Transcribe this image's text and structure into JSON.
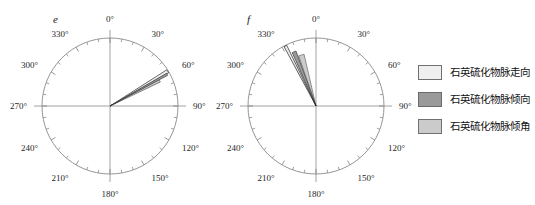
{
  "figure": {
    "background": "#ffffff",
    "panels": [
      {
        "id": "e",
        "label": "e",
        "center_x": 110,
        "center_y": 106,
        "radius": 68,
        "tick_labels": [
          "0°",
          "30°",
          "60°",
          "90°",
          "120°",
          "150°",
          "180°",
          "210°",
          "240°",
          "270°",
          "300°",
          "330°"
        ]
      },
      {
        "id": "f",
        "label": "f",
        "center_x": 110,
        "center_y": 106,
        "radius": 68,
        "tick_labels": [
          "0°",
          "30°",
          "60°",
          "90°",
          "120°",
          "150°",
          "180°",
          "210°",
          "240°",
          "270°",
          "300°",
          "330°"
        ]
      }
    ]
  },
  "legend": {
    "items": [
      {
        "label": "石英硫化物脉走向",
        "color": "#efefef",
        "border": "#707070"
      },
      {
        "label": "石英硫化物脉倾向",
        "color": "#9a9a9a",
        "border": "#6a6a6a"
      },
      {
        "label": "石英硫化物脉倾角",
        "color": "#cbcbcb",
        "border": "#707070"
      }
    ]
  },
  "chart_data": [
    {
      "type": "rose",
      "id": "e",
      "title": "e",
      "angle_unit": "degrees",
      "angle_zero": "north",
      "angle_direction": "clockwise",
      "radial_max": 1.0,
      "grid": false,
      "axis_ticks_every_deg": 10,
      "labeled_ticks_every_deg": 30,
      "tick_labels": [
        "0°",
        "30°",
        "60°",
        "90°",
        "120°",
        "150°",
        "180°",
        "210°",
        "240°",
        "270°",
        "300°",
        "330°"
      ],
      "petals": [
        {
          "series": "石英硫化物脉走向",
          "center_deg": 59,
          "width_deg": 3.0,
          "radius_frac": 0.99,
          "fill": "#efefef",
          "stroke": "#2a2a2a"
        },
        {
          "series": "石英硫化物脉倾向",
          "center_deg": 61,
          "width_deg": 2.0,
          "radius_frac": 0.96,
          "fill": "#9a9a9a",
          "stroke": "#3a3a3a"
        },
        {
          "series": "石英硫化物脉倾角",
          "center_deg": 63,
          "width_deg": 3.0,
          "radius_frac": 0.82,
          "fill": "#cbcbcb",
          "stroke": "#555555"
        }
      ]
    },
    {
      "type": "rose",
      "id": "f",
      "title": "f",
      "angle_unit": "degrees",
      "angle_zero": "north",
      "angle_direction": "clockwise",
      "radial_max": 1.0,
      "grid": false,
      "axis_ticks_every_deg": 10,
      "labeled_ticks_every_deg": 30,
      "tick_labels": [
        "0°",
        "30°",
        "60°",
        "90°",
        "120°",
        "150°",
        "180°",
        "210°",
        "240°",
        "270°",
        "300°",
        "330°"
      ],
      "petals": [
        {
          "series": "石英硫化物脉走向",
          "center_deg": 333,
          "width_deg": 2.5,
          "radius_frac": 0.99,
          "fill": "#efefef",
          "stroke": "#1f1f1f"
        },
        {
          "series": "石英硫化物脉倾向",
          "center_deg": 338,
          "width_deg": 4.0,
          "radius_frac": 0.86,
          "fill": "#9a9a9a",
          "stroke": "#3a3a3a"
        },
        {
          "series": "石英硫化物脉倾角",
          "center_deg": 344,
          "width_deg": 6.0,
          "radius_frac": 0.78,
          "fill": "#cbcbcb",
          "stroke": "#6a6a6a"
        }
      ]
    }
  ]
}
